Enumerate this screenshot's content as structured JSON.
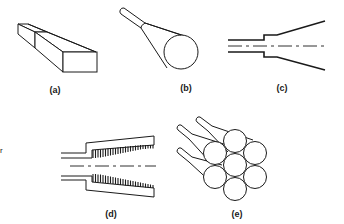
{
  "figure": {
    "panels": [
      {
        "id": "a",
        "label": "(a)",
        "description": "tapered rectangular slab waveguide"
      },
      {
        "id": "b",
        "label": "(b)",
        "description": "tapered fiber expanding to circular end"
      },
      {
        "id": "c",
        "label": "(c)",
        "description": "step then linear taper, cross-section with axis"
      },
      {
        "id": "d",
        "label": "(d)",
        "description": "taper with grating teeth, cross-section with axis"
      },
      {
        "id": "e",
        "label": "(e)",
        "description": "bundle of seven tapered fibers in hexagonal packing"
      }
    ],
    "edge_mark": "r"
  }
}
